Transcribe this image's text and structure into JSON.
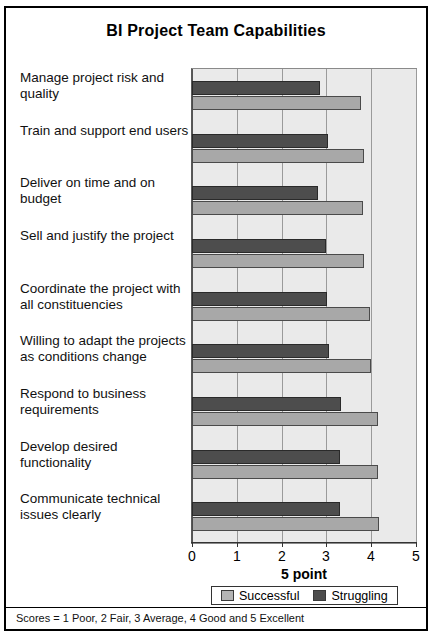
{
  "chart_data": {
    "type": "bar",
    "orientation": "horizontal",
    "title": "BI Project Team Capabilities",
    "xlabel": "5 point",
    "ylabel": "",
    "xlim": [
      0,
      5
    ],
    "xticks": [
      0,
      1,
      2,
      3,
      4,
      5
    ],
    "xticklabels": [
      "0",
      "1",
      "2",
      "3",
      "4",
      "5"
    ],
    "grid": true,
    "legend_position": "bottom",
    "categories": [
      "Manage project risk and quality",
      "Train and support end users",
      "Deliver on time and on budget",
      "Sell and justify the project",
      "Coordinate the project with all constituencies",
      "Willing to adapt the projects as conditions change",
      "Respond to business requirements",
      "Develop desired functionality",
      "Communicate technical issues clearly"
    ],
    "series": [
      {
        "name": "Successful",
        "color": "#a8a8a8",
        "values": [
          3.78,
          3.84,
          3.82,
          3.84,
          3.98,
          3.99,
          4.16,
          4.16,
          4.18
        ]
      },
      {
        "name": "Struggling",
        "color": "#4d4d4d",
        "values": [
          2.86,
          3.04,
          2.82,
          3.0,
          3.02,
          3.06,
          3.33,
          3.31,
          3.3
        ]
      }
    ],
    "footnote": "Scores = 1 Poor, 2 Fair, 3 Average, 4 Good and 5 Excellent"
  }
}
